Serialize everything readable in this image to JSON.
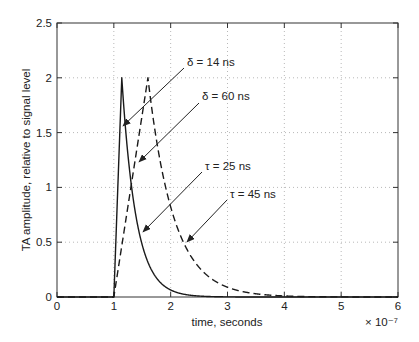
{
  "figure": {
    "width": 419,
    "height": 342,
    "background": "#ffffff"
  },
  "chart_data": {
    "type": "line",
    "title": "",
    "xlabel": "time, seconds",
    "x_offset_label": "× 10⁻⁷",
    "ylabel": "TA amplitude, relative to signal level",
    "xlim": [
      0,
      6
    ],
    "ylim": [
      0,
      2.5
    ],
    "xticks": [
      0,
      1,
      2,
      3,
      4,
      5,
      6
    ],
    "xtick_labels": [
      "0",
      "1",
      "2",
      "3",
      "4",
      "5",
      "6"
    ],
    "yticks": [
      0,
      0.5,
      1,
      1.5,
      2,
      2.5
    ],
    "ytick_labels": [
      "0",
      "0.5",
      "1",
      "1.5",
      "2",
      "2.5"
    ],
    "grid": "dotted",
    "x_units_note": "x values in units of 1e-7 seconds",
    "series": [
      {
        "name": "pulse-delta-14ns-tau-25ns",
        "line_style": "solid",
        "delta_ns": 14,
        "tau_ns": 25,
        "model": {
          "onset": 1.0,
          "rise": 0.14,
          "peak": 2.0,
          "tau": 0.25
        }
      },
      {
        "name": "pulse-delta-60ns-tau-45ns",
        "line_style": "dashed",
        "delta_ns": 60,
        "tau_ns": 45,
        "model": {
          "onset": 1.0,
          "rise": 0.6,
          "peak": 2.0,
          "tau": 0.45
        }
      }
    ],
    "annotations": [
      {
        "label": "δ = 14 ns",
        "text_px": [
          187,
          62
        ],
        "arrow_from_px": [
          184,
          68
        ],
        "arrow_to_px": [
          123,
          126
        ]
      },
      {
        "label": "δ = 60 ns",
        "text_px": [
          202,
          96
        ],
        "arrow_from_px": [
          199,
          103
        ],
        "arrow_to_px": [
          139,
          162
        ]
      },
      {
        "label": "τ = 25 ns",
        "text_px": [
          205,
          166
        ],
        "arrow_from_px": [
          202,
          172
        ],
        "arrow_to_px": [
          143,
          232
        ]
      },
      {
        "label": "τ = 45 ns",
        "text_px": [
          230,
          194
        ],
        "arrow_from_px": [
          227,
          200
        ],
        "arrow_to_px": [
          187,
          242
        ]
      }
    ],
    "plot_box_px": {
      "left": 57,
      "top": 23,
      "right": 398,
      "bottom": 297
    },
    "legend": "none",
    "colors": {
      "axis": "#333333",
      "grid": "#b8b8b8",
      "text": "#222222",
      "curve": "#1a1a1a",
      "background": "#ffffff"
    }
  }
}
